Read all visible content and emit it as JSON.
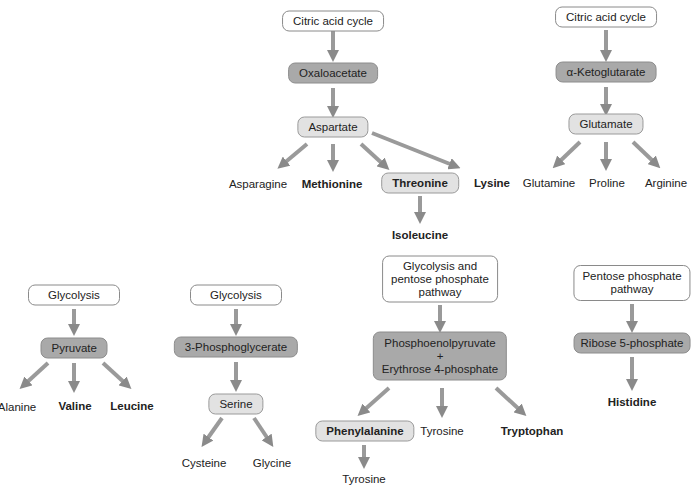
{
  "diagram": {
    "families": [
      {
        "name": "oxaloacetate-family",
        "source": "Citric acid cycle",
        "precursor": "Oxaloacetate",
        "intermediate": "Aspartate",
        "products": [
          "Asparagine",
          "Methionine",
          "Threonine",
          "Lysine"
        ],
        "essential": [
          "Methionine",
          "Threonine",
          "Lysine"
        ],
        "secondary": {
          "from": "Threonine",
          "to": "Isoleucine"
        }
      },
      {
        "name": "ketoglutarate-family",
        "source": "Citric acid cycle",
        "precursor": "α-Ketoglutarate",
        "intermediate": "Glutamate",
        "products": [
          "Glutamine",
          "Proline",
          "Arginine"
        ],
        "essential": []
      },
      {
        "name": "pyruvate-family",
        "source": "Glycolysis",
        "precursor": "Pyruvate",
        "products": [
          "Alanine",
          "Valine",
          "Leucine"
        ],
        "essential": [
          "Valine",
          "Leucine"
        ]
      },
      {
        "name": "phosphoglycerate-family",
        "source": "Glycolysis",
        "precursor": "3-Phosphoglycerate",
        "intermediate": "Serine",
        "products": [
          "Cysteine",
          "Glycine"
        ],
        "essential": []
      },
      {
        "name": "aromatic-family",
        "source": "Glycolysis and pentose phosphate pathway",
        "source_lines": [
          "Glycolysis and",
          "pentose phosphate",
          "pathway"
        ],
        "precursor_lines": [
          "Phosphoenolpyruvate",
          "+",
          "Erythrose 4-phosphate"
        ],
        "products": [
          "Phenylalanine",
          "Tyrosine",
          "Tryptophan"
        ],
        "essential": [
          "Phenylalanine",
          "Tryptophan"
        ],
        "secondary": {
          "from": "Phenylalanine",
          "to": "Tyrosine"
        }
      },
      {
        "name": "ribose-family",
        "source_lines": [
          "Pentose phosphate",
          "pathway"
        ],
        "precursor": "Ribose 5-phosphate",
        "products": [
          "Histidine"
        ],
        "essential": [
          "Histidine"
        ]
      }
    ]
  }
}
